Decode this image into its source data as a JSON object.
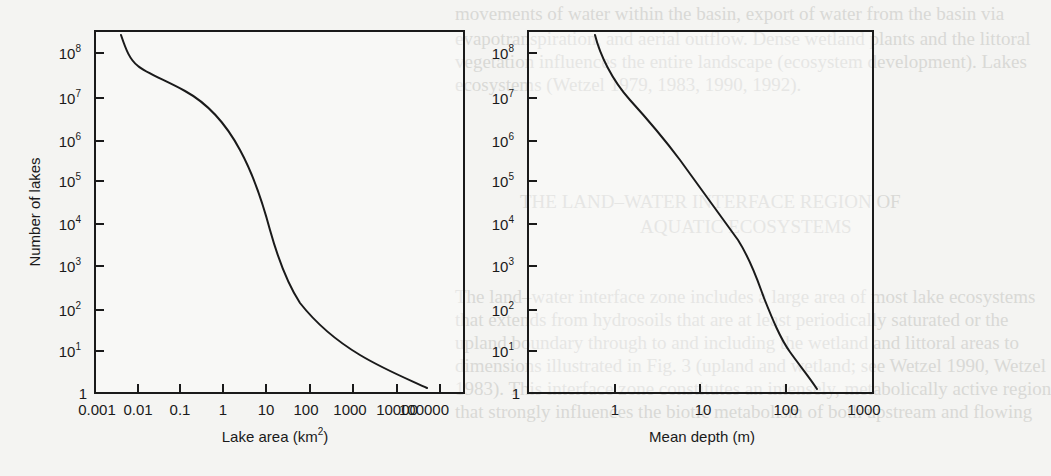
{
  "figure": {
    "background_color": "#f4f4f2",
    "ink_color": "#1a1a1a",
    "bleed_text_color": "#d9d9d6"
  },
  "bleed_text": [
    {
      "text": "movements of water within the basin, export of water from the basin via",
      "x": 455,
      "y": 2
    },
    {
      "text": "evapotranspiration, and aerial outflow. Dense wetland plants and the littoral",
      "x": 455,
      "y": 27
    },
    {
      "text": "vegetation influences the entire landscape (ecosystem development). Lakes",
      "x": 455,
      "y": 50
    },
    {
      "text": "ecosystems (Wetzel 1979, 1983, 1990, 1992).",
      "x": 455,
      "y": 73
    },
    {
      "text": "THE LAND–WATER INTERFACE REGION OF",
      "x": 520,
      "y": 190
    },
    {
      "text": "AQUATIC ECOSYSTEMS",
      "x": 640,
      "y": 215
    },
    {
      "text": "The land–water interface zone includes a large area of most lake ecosystems",
      "x": 455,
      "y": 285
    },
    {
      "text": "that extends from hydrosoils that are at least periodically saturated or the",
      "x": 455,
      "y": 308
    },
    {
      "text": "upland boundary through to and including the wetland and littoral areas to",
      "x": 455,
      "y": 331
    },
    {
      "text": "dimensions illustrated in Fig. 3 (upland and wetland; see Wetzel 1990, Wetzel",
      "x": 455,
      "y": 354
    },
    {
      "text": "1983). This interface zone constitutes an intensely, metabolically active region",
      "x": 455,
      "y": 377
    },
    {
      "text": "that strongly influences the biotic metabolism of both upstream and flowing",
      "x": 455,
      "y": 400
    }
  ],
  "chart_data": [
    {
      "type": "line",
      "title": "",
      "xlabel": "Lake area (km²)",
      "xlabel_base": "Lake area (km",
      "xlabel_sup": "2",
      "xlabel_tail": ")",
      "ylabel": "Number of lakes",
      "xscale": "log",
      "yscale": "log",
      "xlim": [
        0.001,
        200000
      ],
      "ylim": [
        1,
        300000000
      ],
      "grid": false,
      "legend": null,
      "x_ticks": [
        "0.001",
        "0.01",
        "0.1",
        "1",
        "10",
        "100",
        "1000",
        "10000",
        "100000"
      ],
      "y_ticks": [
        {
          "base": "1",
          "exp": ""
        },
        {
          "base": "10",
          "exp": "1"
        },
        {
          "base": "10",
          "exp": "2"
        },
        {
          "base": "10",
          "exp": "3"
        },
        {
          "base": "10",
          "exp": "4"
        },
        {
          "base": "10",
          "exp": "5"
        },
        {
          "base": "10",
          "exp": "6"
        },
        {
          "base": "10",
          "exp": "7"
        },
        {
          "base": "10",
          "exp": "8"
        }
      ],
      "series": [
        {
          "name": "Number of lakes vs lake area",
          "x": [
            0.004,
            0.006,
            0.01,
            0.02,
            0.1,
            0.4,
            2,
            10,
            30,
            100,
            500,
            3000,
            30000
          ],
          "y": [
            250000000,
            55000000,
            30000000,
            15000000,
            5000000,
            460000,
            26000,
            5000,
            800,
            130,
            20,
            3.5,
            1.3
          ]
        }
      ]
    },
    {
      "type": "line",
      "title": "",
      "xlabel": "Mean depth (m)",
      "ylabel": "",
      "xscale": "log",
      "yscale": "log",
      "xlim": [
        0.1,
        1000
      ],
      "ylim": [
        1,
        300000000
      ],
      "grid": false,
      "legend": null,
      "x_ticks": [
        "1",
        "10",
        "100",
        "1000"
      ],
      "y_ticks": [
        {
          "base": "1",
          "exp": ""
        },
        {
          "base": "10",
          "exp": "1"
        },
        {
          "base": "10",
          "exp": "2"
        },
        {
          "base": "10",
          "exp": "3"
        },
        {
          "base": "10",
          "exp": "4"
        },
        {
          "base": "10",
          "exp": "5"
        },
        {
          "base": "10",
          "exp": "6"
        },
        {
          "base": "10",
          "exp": "7"
        },
        {
          "base": "10",
          "exp": "8"
        }
      ],
      "series": [
        {
          "name": "Number of lakes vs mean depth",
          "x": [
            0.6,
            0.8,
            1.3,
            2.2,
            4.2,
            9,
            20,
            30,
            45,
            52,
            72,
            100,
            150,
            200
          ],
          "y": [
            250000000,
            65000000,
            12000000,
            3000000,
            600000,
            90000,
            10000,
            2500,
            700,
            170,
            45,
            12,
            3.5,
            1.3
          ]
        }
      ]
    }
  ],
  "plots": [
    {
      "frame": {
        "left": 95,
        "top": 31,
        "right": 464,
        "bottom": 393
      },
      "x_tick_px": [
        95,
        138,
        180,
        223,
        266,
        310,
        353,
        397,
        440
      ],
      "x_tick_label_px": [
        97,
        138,
        180,
        223,
        266,
        306,
        350,
        0,
        424
      ],
      "y_tick_px": [
        393,
        351,
        310,
        266,
        224,
        181,
        141,
        98,
        53
      ],
      "path": "M121,35 C126,50 130,60 138,66 C146,73 165,80 185,91 C205,102 225,122 240,150 C252,172 262,200 270,230 C277,255 287,283 300,303 C315,322 335,340 360,355 C385,370 410,380 427,388",
      "ylabel_pos": {
        "x": 40,
        "y": 212
      },
      "xlabel_pos": {
        "x": 275,
        "y": 442
      }
    },
    {
      "frame": {
        "left": 528,
        "top": 31,
        "right": 873,
        "bottom": 393
      },
      "x_tick_px": [
        615,
        700,
        786,
        873
      ],
      "x_tick_label_px": [
        615,
        703,
        786,
        864
      ],
      "y_tick_px": [
        393,
        351,
        310,
        266,
        224,
        181,
        141,
        98,
        53
      ],
      "path": "M595,35 C600,55 612,80 630,100 C650,122 665,140 680,160 C700,188 720,215 738,240 C752,262 758,282 764,298 C772,318 780,338 790,352 C800,366 810,378 817,389",
      "ylabel_pos": null,
      "xlabel_pos": {
        "x": 702,
        "y": 442
      }
    }
  ]
}
